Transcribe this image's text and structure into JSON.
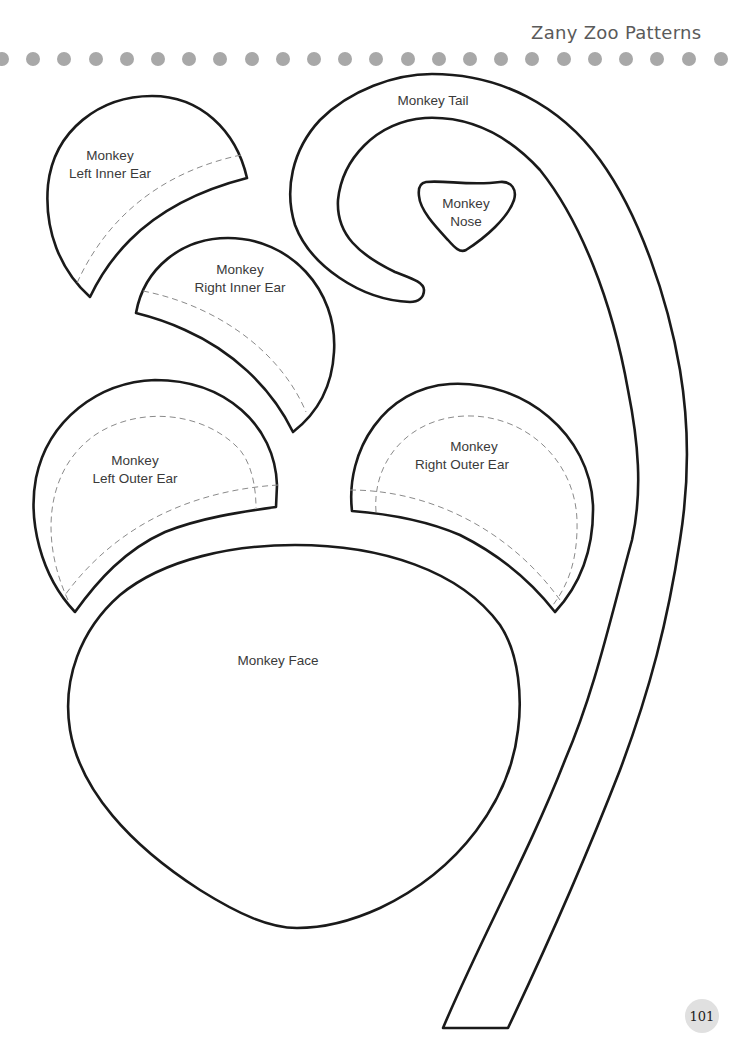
{
  "header": {
    "title": "Zany Zoo Patterns",
    "dot_color": "#a8a8a8",
    "dot_count": 24
  },
  "patterns": {
    "left_inner_ear": {
      "line1": "Monkey",
      "line2": "Left Inner Ear"
    },
    "right_inner_ear": {
      "line1": "Monkey",
      "line2": "Right Inner Ear"
    },
    "tail": {
      "label": "Monkey Tail"
    },
    "nose": {
      "line1": "Monkey",
      "line2": "Nose"
    },
    "left_outer_ear": {
      "line1": "Monkey",
      "line2": "Left Outer Ear"
    },
    "right_outer_ear": {
      "line1": "Monkey",
      "line2": "Right Outer Ear"
    },
    "face": {
      "label": "Monkey Face"
    }
  },
  "footer": {
    "page_number": "101",
    "badge_color": "#e0e0e0"
  }
}
